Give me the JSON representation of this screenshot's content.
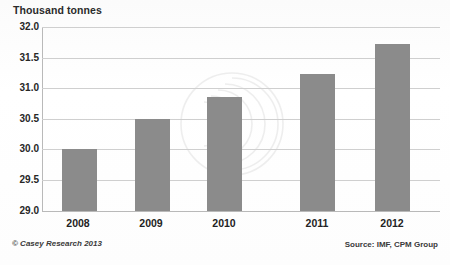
{
  "chart_data": {
    "type": "bar",
    "title": "Thousand tonnes",
    "xlabel": "",
    "ylabel": "Thousand tonnes",
    "categories": [
      "2008",
      "2009",
      "2010",
      "2011",
      "2012"
    ],
    "values": [
      30.0,
      30.5,
      30.85,
      31.23,
      31.72
    ],
    "ylim": [
      29.0,
      32.0
    ],
    "ytick_labels": [
      "32.0",
      "31.5",
      "31.0",
      "30.5",
      "30.0",
      "29.5",
      "29.0"
    ],
    "ytick_values": [
      32.0,
      31.5,
      31.0,
      30.5,
      30.0,
      29.5,
      29.0
    ],
    "grid": true,
    "legend": "none",
    "bar_color": "#8b8b8b",
    "gridline_color": "#cfcfcf",
    "axis_color": "#b9b9b9"
  },
  "footer": {
    "credit": "© Casey Research 2013",
    "source": "Source: IMF, CPM Group"
  },
  "watermark": {
    "name": "concentric-arcs-watermark"
  }
}
